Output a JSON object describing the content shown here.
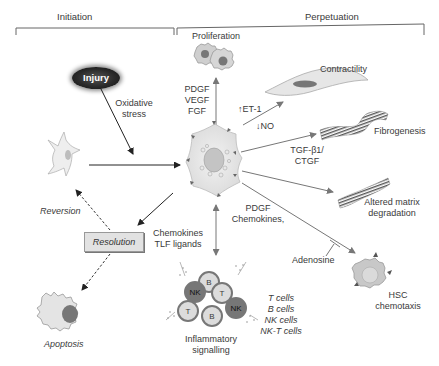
{
  "phases": {
    "initiation": "Initiation",
    "perpetuation": "Perpetuation"
  },
  "nodes": {
    "injury": "Injury",
    "oxidative_stress": [
      "Oxidative",
      "stress"
    ],
    "proliferation": "Proliferation",
    "growth_factors": [
      "PDGF",
      "VEGF",
      "FGF"
    ],
    "contractility": "Contractility",
    "et1": "↑ET-1",
    "no": "↓NO",
    "fibrogenesis": "Fibrogenesis",
    "tgf": [
      "TGF-β1/",
      "CTGF"
    ],
    "altered_matrix": [
      "Altered matrix",
      "degradation"
    ],
    "pdgf_chemokines": [
      "PDGF",
      "Chemokines,"
    ],
    "adenosine": "Adenosine",
    "hsc_chemotaxis": [
      "HSC",
      "chemotaxis"
    ],
    "chemokines_tlf": [
      "Chemokines",
      "TLF ligands"
    ],
    "immune_cells": [
      "T cells",
      "B cells",
      "NK cells",
      "NK-T cells"
    ],
    "inflammatory": [
      "Inflammatory",
      "signalling"
    ],
    "reversion": "Reversion",
    "resolution": "Resolution",
    "apoptosis": "Apoptosis"
  },
  "cluster_labels": [
    "B",
    "NK",
    "T",
    "T",
    "B",
    "NK"
  ],
  "colors": {
    "arrow": "#7a7a7a",
    "dark_arrow": "#333333",
    "cell_fill": "#e9e9e9",
    "cell_stroke": "#b5b5b5",
    "resolution_box": "#e2e2e2"
  }
}
